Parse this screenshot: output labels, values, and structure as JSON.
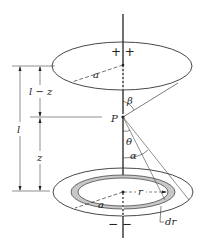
{
  "diagram": {
    "labels": {
      "top_signs": "+ +",
      "bottom_signs": "− −",
      "top_radius": "a",
      "bottom_radius": "a",
      "point": "P",
      "beta": "β",
      "theta": "θ",
      "alpha": "α",
      "ring_radius": "r",
      "ring_width": "dr",
      "dim_l_minus_z": "l − z",
      "dim_z": "z",
      "dim_l": "l"
    },
    "colors": {
      "line": "#222222",
      "ring_fill": "#c8c8c8"
    }
  }
}
